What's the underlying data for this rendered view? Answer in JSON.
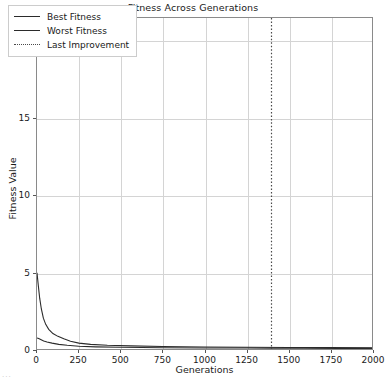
{
  "chart_data": {
    "type": "line",
    "title": "Fitness Across Generations",
    "xlabel": "Generations",
    "ylabel": "Fitness Value",
    "xlim": [
      0,
      2000
    ],
    "ylim": [
      0,
      21.5
    ],
    "grid": true,
    "legend_position": "upper left",
    "xticks": [
      0,
      250,
      500,
      750,
      1000,
      1250,
      1500,
      1750,
      2000
    ],
    "xtick_labels": [
      "0",
      "250",
      "500",
      "750",
      "1000",
      "1250",
      "1500",
      "1750",
      "2000"
    ],
    "yticks": [
      0,
      5,
      10,
      15,
      20
    ],
    "ytick_labels": [
      "0",
      "5",
      "10",
      "15",
      "20"
    ],
    "series": [
      {
        "name": "Best Fitness",
        "style": "solid",
        "color": "#2b2b2b",
        "x": [
          0,
          10,
          25,
          40,
          60,
          90,
          130,
          180,
          250,
          350,
          500,
          750,
          1000,
          1250,
          1400,
          1600,
          1800,
          2000
        ],
        "y": [
          0.72,
          0.68,
          0.6,
          0.52,
          0.45,
          0.38,
          0.3,
          0.24,
          0.18,
          0.14,
          0.11,
          0.08,
          0.07,
          0.06,
          0.05,
          0.05,
          0.04,
          0.04
        ]
      },
      {
        "name": "Worst Fitness",
        "style": "solid",
        "color": "#2b2b2b",
        "x": [
          0,
          8,
          16,
          26,
          38,
          52,
          70,
          95,
          125,
          160,
          200,
          250,
          320,
          420,
          560,
          750,
          1000,
          1250,
          1500,
          1750,
          2000
        ],
        "y": [
          4.95,
          4.1,
          3.3,
          2.6,
          2.0,
          1.6,
          1.28,
          1.0,
          0.82,
          0.66,
          0.5,
          0.38,
          0.3,
          0.24,
          0.2,
          0.16,
          0.13,
          0.11,
          0.1,
          0.09,
          0.08
        ]
      }
    ],
    "annotations": [
      {
        "name": "Last Improvement",
        "type": "vline",
        "style": "dotted",
        "color": "#4a4a4a",
        "x": 1400
      }
    ],
    "legend_entries": [
      {
        "label": "Best Fitness",
        "style": "solid"
      },
      {
        "label": "Worst Fitness",
        "style": "solid"
      },
      {
        "label": "Last Improvement",
        "style": "dotted"
      }
    ]
  },
  "artifact": {
    "text": "..."
  }
}
